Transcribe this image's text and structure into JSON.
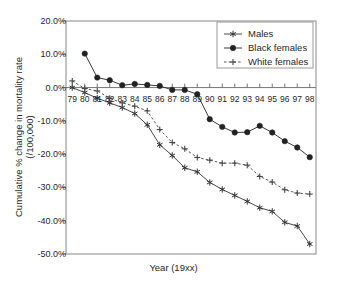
{
  "chart_data": {
    "type": "line",
    "title": "",
    "xlabel": "Year (19xx)",
    "ylabel": "Cumulative % change in mortality rate\n(/100,000)",
    "ylabel_line1": "Cumulative % change in mortality rate",
    "ylabel_line2": "(/100,000)",
    "x": [
      79,
      80,
      81,
      82,
      83,
      84,
      85,
      86,
      87,
      88,
      89,
      90,
      91,
      92,
      93,
      94,
      95,
      96,
      97,
      98
    ],
    "categories": [
      "79",
      "80",
      "81",
      "82",
      "83",
      "84",
      "85",
      "86",
      "87",
      "88",
      "89",
      "90",
      "91",
      "92",
      "93",
      "94",
      "95",
      "96",
      "97",
      "98"
    ],
    "xlim": [
      78.5,
      98.5
    ],
    "ylim": [
      -50,
      20
    ],
    "yticks": [
      20,
      10,
      0,
      -10,
      -20,
      -30,
      -40,
      -50
    ],
    "ytick_labels": [
      "20.0%",
      "10.0%",
      "0.0%",
      "-10.0%",
      "-20.0%",
      "-30.0%",
      "-40.0%",
      "-50.0%"
    ],
    "grid": false,
    "zero_line": true,
    "legend_position": "top-right",
    "series": [
      {
        "name": "Males",
        "marker": "asterisk",
        "line_style": "solid",
        "color": "#333333",
        "x": [
          79,
          80,
          81,
          82,
          83,
          84,
          85,
          86,
          87,
          88,
          89,
          90,
          91,
          92,
          93,
          94,
          95,
          96,
          97,
          98
        ],
        "values": [
          0.0,
          -1.5,
          -3.2,
          -4.6,
          -6.0,
          -7.8,
          -11.2,
          -17.2,
          -20.4,
          -24.1,
          -25.3,
          -28.5,
          -30.6,
          -32.4,
          -34.2,
          -36.1,
          -37.2,
          -40.5,
          -41.6,
          -47.0
        ]
      },
      {
        "name": "Black females",
        "marker": "circle",
        "line_style": "solid",
        "color": "#222222",
        "x": [
          80,
          81,
          82,
          83,
          84,
          85,
          86,
          87,
          88,
          89,
          90,
          91,
          92,
          93,
          94,
          95,
          96,
          97,
          98
        ],
        "values": [
          10.2,
          3.0,
          2.2,
          0.7,
          1.1,
          0.8,
          0.5,
          -0.7,
          -0.7,
          -2.0,
          -9.5,
          -11.8,
          -13.5,
          -13.4,
          -11.5,
          -13.5,
          -16.1,
          -18.0,
          -20.9
        ]
      },
      {
        "name": "White females",
        "marker": "plus",
        "line_style": "dashed",
        "color": "#444444",
        "x": [
          79,
          80,
          81,
          82,
          83,
          84,
          85,
          86,
          87,
          88,
          89,
          90,
          91,
          92,
          93,
          94,
          95,
          96,
          97,
          98
        ],
        "values": [
          2.0,
          -0.3,
          -1.0,
          -3.2,
          -4.6,
          -5.6,
          -7.0,
          -12.6,
          -16.5,
          -18.4,
          -21.0,
          -21.8,
          -22.7,
          -22.7,
          -23.3,
          -26.7,
          -28.4,
          -30.7,
          -31.7,
          -32.0
        ]
      }
    ]
  },
  "legend": {
    "items": [
      {
        "label": "Males",
        "marker": "asterisk"
      },
      {
        "label": "Black females",
        "marker": "circle"
      },
      {
        "label": "White females",
        "marker": "plus"
      }
    ]
  },
  "colors": {
    "axis": "#555555",
    "text": "#1f1f1f",
    "series_males": "#333333",
    "series_black_females": "#222222",
    "series_white_females": "#444444",
    "frame": "#888888"
  }
}
